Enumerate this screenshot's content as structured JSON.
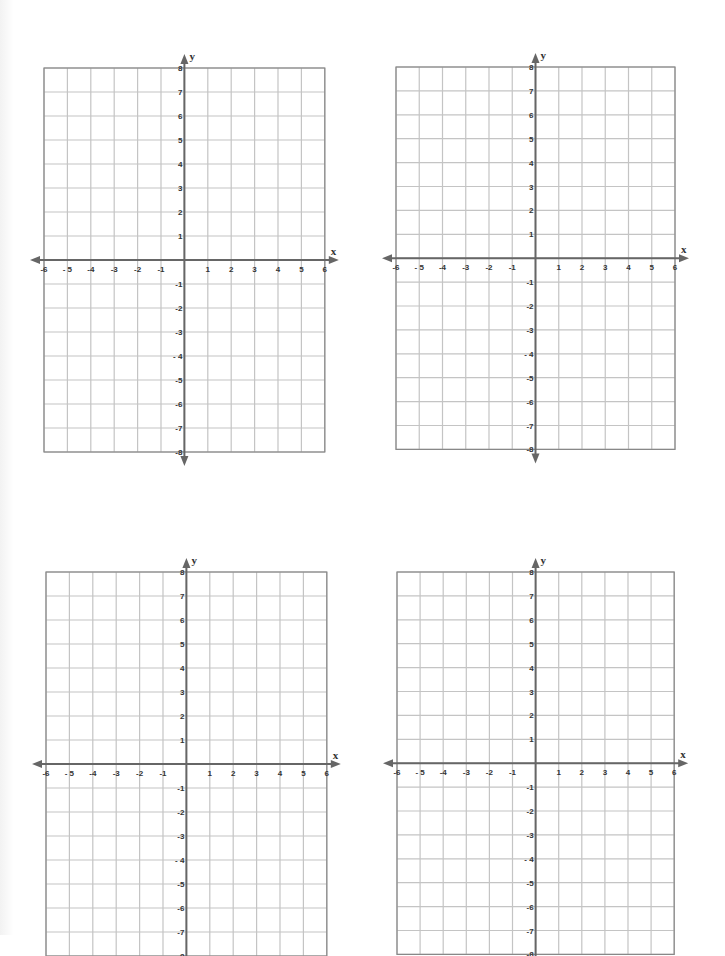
{
  "page": {
    "grid_line_color": "#c4c4c4",
    "axis_color": "#666666",
    "border_color": "#888888"
  },
  "planes": [
    {
      "id": "plane-1",
      "x_label": "x",
      "y_label": "y",
      "left": 44,
      "top": 68,
      "unit_x": 23.4,
      "unit_y": 24.0,
      "origin_x": 140,
      "origin_y": 191
    },
    {
      "id": "plane-2",
      "x_label": "x",
      "y_label": "y",
      "left": 396,
      "top": 67,
      "unit_x": 23.25,
      "unit_y": 23.9,
      "origin_x": 139,
      "origin_y": 191
    },
    {
      "id": "plane-3",
      "x_label": "x",
      "y_label": "y",
      "left": 46,
      "top": 572,
      "unit_x": 23.4,
      "unit_y": 24.0,
      "origin_x": 140,
      "origin_y": 192
    },
    {
      "id": "plane-4",
      "x_label": "x",
      "y_label": "y",
      "left": 397,
      "top": 572,
      "unit_x": 23.1,
      "unit_y": 23.9,
      "origin_x": 138,
      "origin_y": 191
    }
  ],
  "axes": {
    "x_min": -6,
    "x_max": 6,
    "y_min": -8,
    "y_max": 8,
    "x_tick_labels": [
      "-6",
      "- 5",
      "-4",
      "-3",
      "-2",
      "-1",
      "1",
      "2",
      "3",
      "4",
      "5",
      "6"
    ],
    "y_tick_labels_positive": [
      "1",
      "2",
      "3",
      "4",
      "5",
      "6",
      "7",
      "8"
    ],
    "y_tick_labels_negative": [
      "-1",
      "-2",
      "-3",
      "- 4",
      "-5",
      "-6",
      "-7",
      "-8"
    ]
  },
  "chart_data": [
    {
      "type": "scatter",
      "title": "",
      "xlabel": "x",
      "ylabel": "y",
      "xlim": [
        -6,
        6
      ],
      "ylim": [
        -8,
        8
      ],
      "grid": true,
      "series": []
    },
    {
      "type": "scatter",
      "title": "",
      "xlabel": "x",
      "ylabel": "y",
      "xlim": [
        -6,
        6
      ],
      "ylim": [
        -8,
        8
      ],
      "grid": true,
      "series": []
    },
    {
      "type": "scatter",
      "title": "",
      "xlabel": "x",
      "ylabel": "y",
      "xlim": [
        -6,
        6
      ],
      "ylim": [
        -8,
        8
      ],
      "grid": true,
      "series": []
    },
    {
      "type": "scatter",
      "title": "",
      "xlabel": "x",
      "ylabel": "y",
      "xlim": [
        -6,
        6
      ],
      "ylim": [
        -8,
        8
      ],
      "grid": true,
      "series": []
    }
  ]
}
